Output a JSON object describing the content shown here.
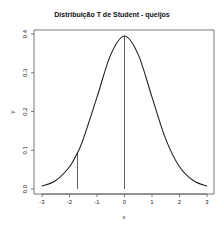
{
  "chart_data": {
    "type": "line",
    "title": "Distribuição T de Student - queijos",
    "xlabel": "x",
    "ylabel": "y",
    "xlim": [
      -3,
      3
    ],
    "ylim": [
      0,
      0.4
    ],
    "x_ticks": [
      "-3",
      "-2",
      "-1",
      "0",
      "1",
      "2",
      "3"
    ],
    "y_ticks": [
      "0.0",
      "0.1",
      "0.2",
      "0.3",
      "0.4"
    ],
    "grid": false,
    "legend": null,
    "series": [
      {
        "name": "t density",
        "x": [
          -3,
          -2.5,
          -2,
          -1.71,
          -1.5,
          -1,
          -0.5,
          0,
          0.5,
          1,
          1.5,
          2,
          2.5,
          3
        ],
        "y": [
          0.0074,
          0.0219,
          0.0575,
          0.0938,
          0.1288,
          0.237,
          0.3468,
          0.3948,
          0.3468,
          0.237,
          0.1288,
          0.0575,
          0.0219,
          0.0074
        ]
      }
    ],
    "vertical_lines": [
      {
        "x": -1.71,
        "y_from": 0,
        "y_to": 0.0938,
        "label": "critical value"
      },
      {
        "x": 0,
        "y_from": 0,
        "y_to": 0.3948,
        "label": "mean"
      }
    ]
  },
  "colors": {
    "line": "#222222",
    "axis": "#555555",
    "background": "#ffffff"
  }
}
